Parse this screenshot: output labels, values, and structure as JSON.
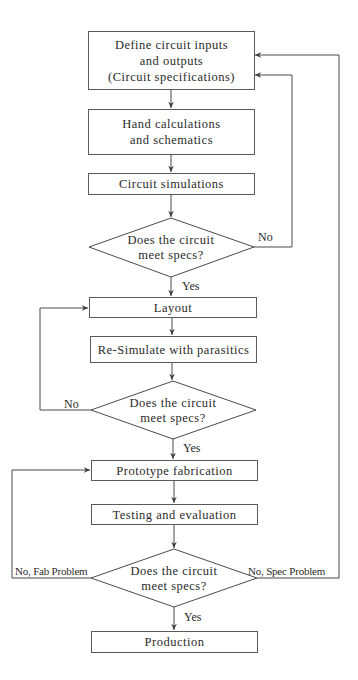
{
  "diagram": {
    "type": "flowchart",
    "steps": [
      {
        "id": "define",
        "lines": [
          "Define circuit inputs",
          "and outputs",
          "(Circuit specifications)"
        ]
      },
      {
        "id": "hand",
        "lines": [
          "Hand calculations",
          "and schematics"
        ]
      },
      {
        "id": "sim",
        "lines": [
          "Circuit simulations"
        ]
      },
      {
        "id": "layout",
        "lines": [
          "Layout"
        ]
      },
      {
        "id": "resim",
        "lines": [
          "Re-Simulate with parasitics"
        ]
      },
      {
        "id": "proto",
        "lines": [
          "Prototype fabrication"
        ]
      },
      {
        "id": "test",
        "lines": [
          "Testing and evaluation"
        ]
      },
      {
        "id": "prod",
        "lines": [
          "Production"
        ]
      }
    ],
    "decisions": [
      {
        "id": "check1",
        "lines": [
          "Does the circuit",
          "meet specs?"
        ],
        "yes_label": "Yes",
        "no_label": "No"
      },
      {
        "id": "check2",
        "lines": [
          "Does the circuit",
          "meet specs?"
        ],
        "yes_label": "Yes",
        "no_label": "No"
      },
      {
        "id": "check3",
        "lines": [
          "Does the circuit",
          "meet specs?"
        ],
        "yes_label": "Yes",
        "no_fab_label": "No, Fab Problem",
        "no_spec_label": "No, Spec Problem"
      }
    ],
    "edges": [
      {
        "from": "define",
        "to": "hand"
      },
      {
        "from": "hand",
        "to": "sim"
      },
      {
        "from": "sim",
        "to": "check1"
      },
      {
        "from": "check1",
        "to": "layout",
        "label": "Yes"
      },
      {
        "from": "check1",
        "to": "define",
        "label": "No"
      },
      {
        "from": "layout",
        "to": "resim"
      },
      {
        "from": "resim",
        "to": "check2"
      },
      {
        "from": "check2",
        "to": "proto",
        "label": "Yes"
      },
      {
        "from": "check2",
        "to": "layout",
        "label": "No"
      },
      {
        "from": "proto",
        "to": "test"
      },
      {
        "from": "test",
        "to": "check3"
      },
      {
        "from": "check3",
        "to": "prod",
        "label": "Yes"
      },
      {
        "from": "check3",
        "to": "proto",
        "label": "No, Fab Problem"
      },
      {
        "from": "check3",
        "to": "define",
        "label": "No, Spec Problem"
      }
    ],
    "colors": {
      "line": "#4a4a4a",
      "text": "#2a2a2a",
      "background": "#ffffff"
    }
  }
}
